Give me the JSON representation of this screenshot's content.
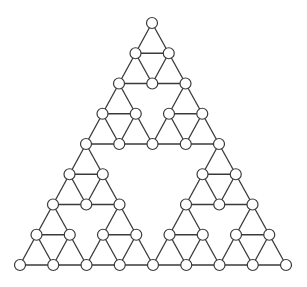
{
  "diagram": {
    "type": "sierpinski-graph",
    "levels": 3,
    "top": [
      152,
      23
    ],
    "bottom_left": [
      20,
      265
    ],
    "bottom_right": [
      286,
      265
    ],
    "node_radius": 5.5,
    "colors": {
      "edge": "#3a3a3a",
      "node_fill": "#ffffff",
      "node_stroke": "#3a3a3a"
    }
  }
}
